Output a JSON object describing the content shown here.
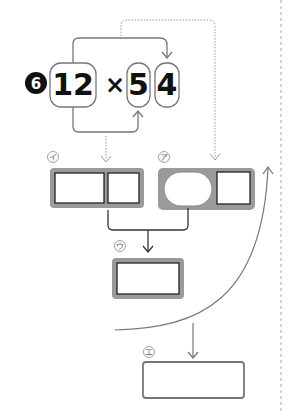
{
  "problem": {
    "number": "6",
    "multiplicand": "12",
    "operator": "×",
    "multiplier_tens": "5",
    "multiplier_ones": "4"
  },
  "labels": {
    "a": "ア",
    "i": "イ",
    "u": "ウ",
    "e": "エ"
  },
  "colors": {
    "box_fill": "#9a9a9a",
    "line_gray": "#777777",
    "dotted": "#999999",
    "text": "#111111"
  }
}
